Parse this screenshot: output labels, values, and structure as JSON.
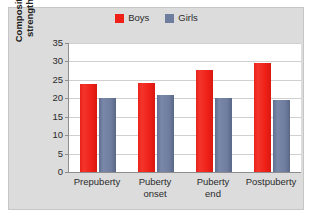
{
  "chart_data": {
    "type": "bar",
    "title": "",
    "xlabel": "",
    "ylabel": "Composite static strength score",
    "ylim": [
      0,
      35
    ],
    "yticks": [
      0,
      5,
      10,
      15,
      20,
      25,
      30,
      35
    ],
    "grid": true,
    "legend_position": "top-center",
    "categories": [
      "Prepuberty",
      "Puberty onset",
      "Puberty end",
      "Postpuberty"
    ],
    "series": [
      {
        "name": "Boys",
        "color": "#ee2017",
        "values": [
          24.0,
          24.2,
          27.6,
          29.6
        ]
      },
      {
        "name": "Girls",
        "color": "#6f7d9f",
        "values": [
          20.0,
          20.8,
          20.1,
          19.6
        ]
      }
    ]
  },
  "legend": {
    "items": [
      {
        "label": "Boys",
        "color": "#ee2017"
      },
      {
        "label": "Girls",
        "color": "#6f7d9f"
      }
    ]
  },
  "axes": {
    "y_title_line1": "Composite static",
    "y_title_line2": "strength score",
    "y_tick_labels": [
      "35",
      "30",
      "25",
      "20",
      "15",
      "10",
      "5",
      "0"
    ]
  },
  "x_axis": {
    "labels": [
      {
        "line1": "Prepuberty",
        "line2": ""
      },
      {
        "line1": "Puberty",
        "line2": "onset"
      },
      {
        "line1": "Puberty",
        "line2": "end"
      },
      {
        "line1": "Postpuberty",
        "line2": ""
      }
    ]
  }
}
